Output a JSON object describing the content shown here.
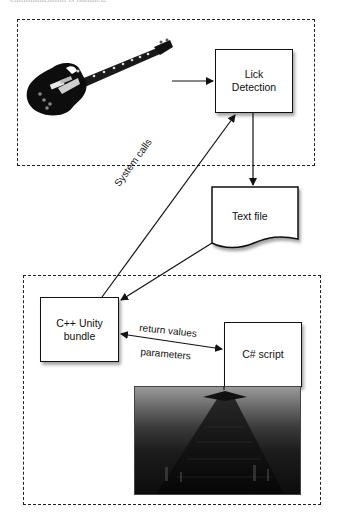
{
  "caption_fragment": "communication is handled.",
  "groups": {
    "top": {
      "label": "input-processing-group"
    },
    "bottom": {
      "label": "unity-group"
    }
  },
  "nodes": {
    "guitar": {
      "icon": "electric-guitar-icon"
    },
    "lick_detection": {
      "label_line1": "Lick",
      "label_line2": "Detection"
    },
    "text_file": {
      "label": "Text file"
    },
    "cpp_bundle": {
      "label_line1": "C++ Unity",
      "label_line2": "bundle"
    },
    "csharp_script": {
      "label": "C# script"
    },
    "scene": {
      "icon": "3d-scene-render-image"
    }
  },
  "edges": {
    "guitar_to_lick": {
      "from": "guitar",
      "to": "lick_detection"
    },
    "lick_to_textfile": {
      "from": "lick_detection",
      "to": "text_file"
    },
    "textfile_to_cpp": {
      "from": "text_file",
      "to": "cpp_bundle"
    },
    "system_calls": {
      "from": "cpp_bundle",
      "to": "lick_detection",
      "label": "System calls"
    },
    "cpp_csharp": {
      "from": "cpp_bundle",
      "to": "csharp_script",
      "label_top": "return values",
      "label_bottom": "parameters"
    }
  },
  "colors": {
    "stroke": "#111111",
    "background": "#ffffff"
  }
}
